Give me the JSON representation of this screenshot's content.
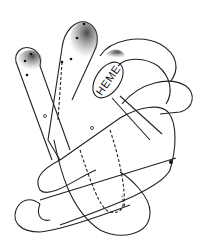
{
  "diagram": {
    "type": "protein-fold-illustration",
    "labels": {
      "heme": "HEME"
    },
    "colors": {
      "line": "#222222",
      "shading": "#555555",
      "background": "#ffffff"
    },
    "elements": [
      {
        "name": "helix-left-tube",
        "kind": "rod"
      },
      {
        "name": "helix-center-tube",
        "kind": "rod"
      },
      {
        "name": "heme-group",
        "kind": "ellipse",
        "label_ref": "labels.heme"
      },
      {
        "name": "loop-right-upper",
        "kind": "curve"
      },
      {
        "name": "loop-right-lower",
        "kind": "curve"
      },
      {
        "name": "loop-bottom",
        "kind": "curve"
      },
      {
        "name": "hook-left-bottom",
        "kind": "curve"
      }
    ]
  }
}
